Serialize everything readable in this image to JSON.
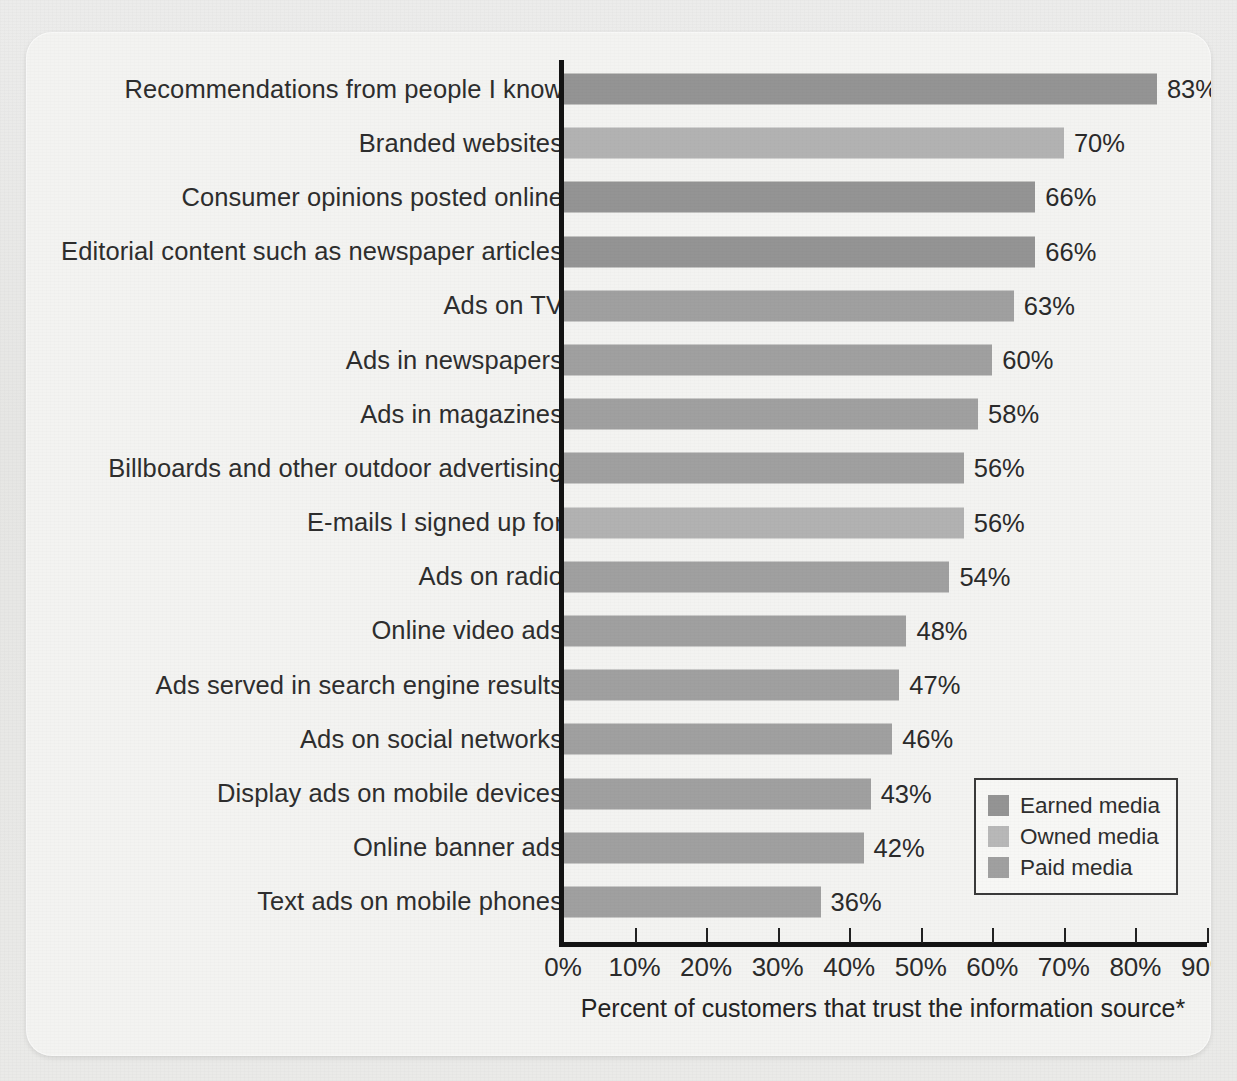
{
  "chart_data": {
    "type": "bar",
    "orientation": "horizontal",
    "title": "",
    "xlabel": "Percent of customers that trust the information source*",
    "ylabel": "",
    "xlim": [
      0,
      90
    ],
    "grid": false,
    "legend_position": "bottom-right",
    "categories": [
      "Recommendations from people I know",
      "Branded websites",
      "Consumer opinions posted online",
      "Editorial content such as newspaper articles",
      "Ads on TV",
      "Ads in newspapers",
      "Ads in magazines",
      "Billboards and other outdoor advertising",
      "E-mails I signed up for",
      "Ads on radio",
      "Online video ads",
      "Ads served in search engine results",
      "Ads on social networks",
      "Display ads on mobile devices",
      "Online banner ads",
      "Text ads on mobile phones"
    ],
    "values": [
      83,
      70,
      66,
      66,
      63,
      60,
      58,
      56,
      56,
      54,
      48,
      47,
      46,
      43,
      42,
      36
    ],
    "value_labels": [
      "83%",
      "70%",
      "66%",
      "66%",
      "63%",
      "60%",
      "58%",
      "56%",
      "56%",
      "54%",
      "48%",
      "47%",
      "46%",
      "43%",
      "42%",
      "36%"
    ],
    "series_of_point": [
      "earned",
      "owned",
      "earned",
      "earned",
      "paid",
      "paid",
      "paid",
      "paid",
      "owned",
      "paid",
      "paid",
      "paid",
      "paid",
      "paid",
      "paid",
      "paid"
    ],
    "xticks": [
      0,
      10,
      20,
      30,
      40,
      50,
      60,
      70,
      80,
      90
    ],
    "xtick_labels": [
      "0%",
      "10%",
      "20%",
      "30%",
      "40%",
      "50%",
      "60%",
      "70%",
      "80%",
      "90%"
    ],
    "legend": [
      {
        "key": "earned",
        "label": "Earned media",
        "color": "#949494"
      },
      {
        "key": "owned",
        "label": "Owned media",
        "color": "#b8b8b8"
      },
      {
        "key": "paid",
        "label": "Paid media",
        "color": "#a0a0a0"
      }
    ],
    "colors": {
      "earned": "#949494",
      "owned": "#b2b2b2",
      "paid": "#a0a0a0",
      "axis": "#141414",
      "text": "#2b2b2b",
      "card": "#f3f3f1",
      "page": "#e9e9e7"
    }
  }
}
